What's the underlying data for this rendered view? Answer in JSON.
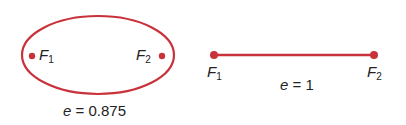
{
  "colors": {
    "curve": "#c8323a",
    "text": "#222222"
  },
  "ellipse": {
    "focus1": {
      "var": "F",
      "sub": "1"
    },
    "focus2": {
      "var": "F",
      "sub": "2"
    },
    "eccentricity_label": {
      "var": "e",
      "rest": " = 0.875"
    }
  },
  "line": {
    "focus1": {
      "var": "F",
      "sub": "1"
    },
    "focus2": {
      "var": "F",
      "sub": "2"
    },
    "eccentricity_label": {
      "var": "e",
      "rest": " = 1"
    }
  }
}
